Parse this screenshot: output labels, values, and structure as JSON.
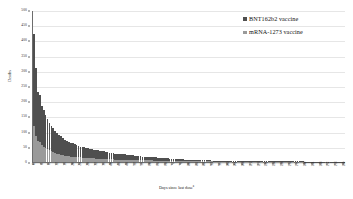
{
  "chart_data": {
    "type": "bar",
    "barmode": "stacked",
    "title": "",
    "xlabel": "Days since last dose",
    "xlabel_superscript": "a",
    "ylabel": "Deaths",
    "ylim": [
      0,
      500
    ],
    "ytick_step": 50,
    "yticks": [
      0,
      50,
      100,
      150,
      200,
      250,
      300,
      350,
      400,
      450,
      500
    ],
    "ytick_labels": [
      "0",
      "50",
      "100",
      "150",
      "200",
      "250",
      "300",
      "350",
      "400",
      "450",
      "500"
    ],
    "xlim": [
      0,
      160
    ],
    "xtick_step": 4,
    "xtick_labels": [
      "0",
      "4",
      "8",
      "12",
      "16",
      "20",
      "24",
      "28",
      "32",
      "36",
      "40",
      "44",
      "48",
      "52",
      "56",
      "60",
      "64",
      "68",
      "72",
      "76",
      "80",
      "84",
      "88",
      "92",
      "96",
      "100",
      "104",
      "108",
      "112",
      "116",
      "120",
      "124",
      "128",
      "132",
      "136",
      "140",
      "144",
      "148",
      "152",
      "156",
      "160"
    ],
    "grid": true,
    "grid_axis": "y",
    "legend_position": "top-right",
    "colors": {
      "bnt162b2": "#4f4f4f",
      "mrna1273": "#9a9a9a",
      "gridline": "#e6e6e6",
      "axis": "#6d6d6d",
      "background": "#ffffff"
    },
    "x": [
      0,
      1,
      2,
      3,
      4,
      5,
      6,
      7,
      8,
      9,
      10,
      11,
      12,
      13,
      14,
      15,
      16,
      17,
      18,
      19,
      20,
      21,
      22,
      23,
      24,
      25,
      26,
      27,
      28,
      29,
      30,
      31,
      32,
      33,
      34,
      35,
      36,
      37,
      38,
      39,
      40,
      41,
      42,
      43,
      44,
      45,
      46,
      47,
      48,
      49,
      50,
      51,
      52,
      53,
      54,
      55,
      56,
      57,
      58,
      59,
      60,
      61,
      62,
      63,
      64,
      65,
      66,
      67,
      68,
      69,
      70,
      71,
      72,
      73,
      74,
      75,
      76,
      77,
      78,
      79,
      80,
      81,
      82,
      83,
      84,
      85,
      86,
      87,
      88,
      89,
      90,
      91,
      92,
      93,
      94,
      95,
      96,
      97,
      98,
      99,
      100,
      101,
      102,
      103,
      104,
      105,
      106,
      107,
      108,
      109,
      110,
      111,
      112,
      113,
      114,
      115,
      116,
      117,
      118,
      119,
      120,
      121,
      122,
      123,
      124,
      125,
      126,
      127,
      128,
      129,
      130,
      131,
      132,
      133,
      134,
      135,
      136,
      137,
      138,
      139,
      140,
      141,
      142,
      143,
      144,
      145,
      146,
      147,
      148,
      149,
      150,
      151,
      152,
      153,
      154,
      155,
      156,
      157,
      158,
      159,
      160
    ],
    "series": [
      {
        "name": "BNT162b2 vaccine",
        "color": "#4f4f4f",
        "values": [
          300,
          225,
          160,
          155,
          130,
          120,
          110,
          100,
          92,
          85,
          80,
          72,
          68,
          64,
          60,
          56,
          52,
          50,
          48,
          45,
          44,
          42,
          40,
          38,
          36,
          35,
          34,
          33,
          32,
          31,
          30,
          29,
          28,
          27,
          26,
          25,
          25,
          24,
          23,
          22,
          22,
          21,
          20,
          20,
          19,
          19,
          18,
          18,
          17,
          17,
          16,
          16,
          15,
          15,
          14,
          14,
          13,
          13,
          12,
          12,
          12,
          11,
          11,
          11,
          10,
          10,
          10,
          9,
          9,
          9,
          8,
          8,
          8,
          8,
          7,
          7,
          7,
          7,
          6,
          6,
          6,
          6,
          5,
          5,
          5,
          5,
          5,
          4,
          4,
          4,
          4,
          4,
          3,
          3,
          3,
          3,
          3,
          3,
          3,
          2,
          2,
          2,
          2,
          2,
          2,
          2,
          2,
          2,
          2,
          2,
          2,
          2,
          1,
          1,
          1,
          1,
          1,
          1,
          1,
          1,
          1,
          1,
          1,
          1,
          1,
          1,
          1,
          1,
          1,
          1,
          1,
          1,
          1,
          1,
          1,
          1,
          1,
          1,
          1,
          1,
          1,
          1,
          1,
          1,
          1,
          1,
          1,
          1,
          1,
          1,
          1,
          1,
          1,
          1,
          1,
          1,
          1,
          1,
          1,
          1,
          1
        ]
      },
      {
        "name": "mRNA-1273 vaccine",
        "color": "#9a9a9a",
        "values": [
          120,
          85,
          70,
          65,
          55,
          50,
          46,
          42,
          38,
          35,
          32,
          30,
          28,
          26,
          24,
          23,
          21,
          20,
          19,
          18,
          17,
          17,
          16,
          15,
          15,
          14,
          14,
          13,
          13,
          12,
          12,
          12,
          11,
          11,
          11,
          10,
          10,
          10,
          9,
          9,
          9,
          9,
          8,
          8,
          8,
          8,
          7,
          7,
          7,
          7,
          7,
          6,
          6,
          6,
          6,
          6,
          5,
          5,
          5,
          5,
          5,
          5,
          4,
          4,
          4,
          4,
          4,
          4,
          4,
          3,
          3,
          3,
          3,
          3,
          3,
          3,
          3,
          3,
          2,
          2,
          2,
          2,
          2,
          2,
          2,
          2,
          2,
          2,
          2,
          2,
          2,
          2,
          2,
          1,
          1,
          1,
          1,
          1,
          1,
          1,
          1,
          1,
          1,
          1,
          1,
          1,
          1,
          1,
          1,
          1,
          1,
          1,
          1,
          1,
          1,
          1,
          1,
          1,
          1,
          1,
          1,
          1,
          1,
          1,
          1,
          1,
          1,
          1,
          1,
          1,
          1,
          1,
          1,
          1,
          1,
          1,
          1,
          1,
          1,
          1,
          0,
          0,
          0,
          0,
          0,
          0,
          0,
          0,
          0,
          0,
          0,
          0,
          0,
          0,
          0,
          0,
          0,
          0,
          0,
          0,
          0
        ]
      }
    ]
  },
  "legend": {
    "items": [
      {
        "label": "BNT162b2 vaccine",
        "color": "#4f4f4f"
      },
      {
        "label": "mRNA-1273 vaccine",
        "color": "#9a9a9a"
      }
    ]
  }
}
